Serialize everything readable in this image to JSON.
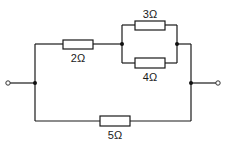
{
  "diagram": {
    "type": "electrical-circuit",
    "resistors": [
      {
        "id": "R1",
        "label": "2Ω",
        "value_ohms": 2,
        "position": "top-left series"
      },
      {
        "id": "R2",
        "label": "3Ω",
        "value_ohms": 3,
        "position": "parallel upper branch"
      },
      {
        "id": "R3",
        "label": "4Ω",
        "value_ohms": 4,
        "position": "parallel lower branch"
      },
      {
        "id": "R4",
        "label": "5Ω",
        "value_ohms": 5,
        "position": "bottom branch"
      }
    ],
    "terminals": [
      "left",
      "right"
    ],
    "topology": "(2Ω in series with (3Ω ∥ 4Ω)) in parallel with 5Ω"
  }
}
